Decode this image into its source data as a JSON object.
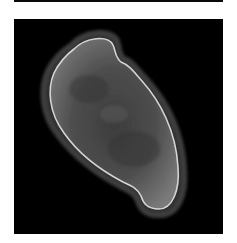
{
  "images": [
    {
      "name": "previous-micrograph-edge",
      "description": "Bottom edge of preceding dark image panel"
    },
    {
      "name": "cell-micrograph",
      "description": "Grayscale micrograph of a single elongated, S-shaped (bean-like) cell on a black background with a bright rim and darker halo",
      "colors": {
        "background": "#000000",
        "cell_fill": "#5a5a5a",
        "rim": "#d8d8d8",
        "halo": "#3a3a3a"
      }
    }
  ]
}
